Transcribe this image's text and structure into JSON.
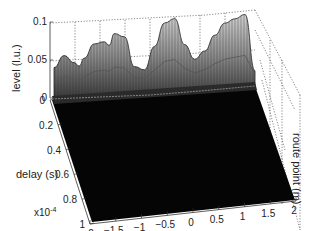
{
  "chart_data": {
    "type": "surface3d",
    "title": "",
    "xlabel": "route point (m)",
    "ylabel": "delay (s)",
    "zlabel": "level (l.u.)",
    "y_multiplier": "x10",
    "y_multiplier_exp": "-4",
    "xlim": [
      -2,
      2
    ],
    "ylim": [
      0,
      1
    ],
    "zlim": [
      0,
      0.1
    ],
    "x_ticks": [
      "-2",
      "-1.5",
      "-1",
      "-0.5",
      "0",
      "0.5",
      "1",
      "1.5",
      "2"
    ],
    "y_ticks": [
      "0",
      "0.2",
      "0.4",
      "0.6",
      "0.8",
      "1"
    ],
    "z_ticks": [
      "0",
      "0.05",
      "0.1"
    ],
    "grid": true,
    "colormap": "grayscale",
    "profile_at_zero_delay": {
      "x": [
        -2.0,
        -1.8,
        -1.6,
        -1.5,
        -1.4,
        -1.2,
        -1.0,
        -0.9,
        -0.8,
        -0.6,
        -0.4,
        -0.2,
        0.0,
        0.2,
        0.4,
        0.6,
        0.8,
        1.0,
        1.2,
        1.4,
        1.6,
        1.8,
        2.0
      ],
      "z": [
        0.04,
        0.055,
        0.045,
        0.04,
        0.05,
        0.068,
        0.07,
        0.065,
        0.08,
        0.075,
        0.035,
        0.03,
        0.06,
        0.09,
        0.095,
        0.06,
        0.04,
        0.05,
        0.07,
        0.085,
        0.09,
        0.095,
        0.02
      ]
    },
    "floor_value": 0
  }
}
